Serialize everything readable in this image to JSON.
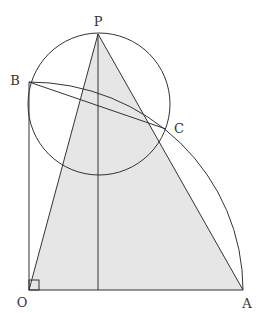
{
  "diagram": {
    "type": "geometry",
    "colors": {
      "stroke": "#333333",
      "shade": "#e6e6e6",
      "background": "#ffffff"
    },
    "points": {
      "P": {
        "label": "P",
        "x": 98,
        "y": 34,
        "label_x": 98,
        "label_y": 21
      },
      "B": {
        "label": "B",
        "x": 29,
        "y": 82,
        "label_x": 15,
        "label_y": 80
      },
      "C": {
        "label": "C",
        "x": 166,
        "y": 129,
        "label_x": 179,
        "label_y": 128
      },
      "O": {
        "label": "O",
        "x": 29,
        "y": 290,
        "label_x": 22,
        "label_y": 302
      },
      "A": {
        "label": "A",
        "x": 243,
        "y": 290,
        "label_x": 247,
        "label_y": 303
      }
    },
    "shaded_triangle": [
      "P",
      "O",
      "A"
    ],
    "circle": {
      "cx": 99,
      "cy": 104,
      "r": 71
    },
    "quarter_arc": {
      "center": "O",
      "from": "B",
      "to": "A"
    },
    "segments": [
      [
        "O",
        "B"
      ],
      [
        "O",
        "A"
      ],
      [
        "P",
        "O"
      ],
      [
        "P",
        "A"
      ],
      [
        "B",
        "C"
      ],
      [
        "P",
        "foot"
      ]
    ],
    "foot": {
      "x": 98,
      "y": 290
    },
    "right_angle_at": "O"
  }
}
